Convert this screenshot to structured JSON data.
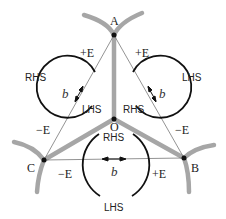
{
  "diagram": {
    "points": {
      "A": {
        "label": "A"
      },
      "B": {
        "label": "B"
      },
      "C": {
        "label": "C"
      },
      "O": {
        "label": "O"
      }
    },
    "loops": [
      {
        "id": "left",
        "top_label": "+E",
        "bottom_label": "−E",
        "outer_label": "RHS",
        "inner_label": "LHS",
        "vector_label": "b⃗"
      },
      {
        "id": "right",
        "top_label": "+E",
        "bottom_label": "−E",
        "outer_label": "LHS",
        "inner_label": "RHS",
        "vector_label": "b⃗"
      },
      {
        "id": "bottom",
        "left_label": "−E",
        "right_label": "+E",
        "top_label": "RHS",
        "bottom_label": "LHS",
        "vector_label": "b⃗"
      }
    ],
    "colors": {
      "grain_boundary": "#a6a6a6",
      "line": "#111111",
      "thin_line": "#666666"
    }
  }
}
